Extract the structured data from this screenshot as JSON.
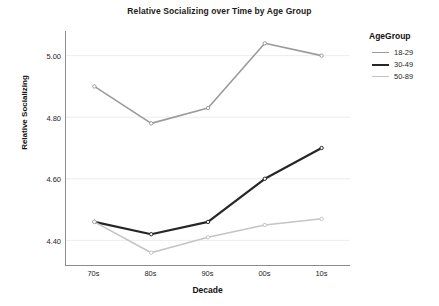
{
  "chart_data": {
    "type": "line",
    "title": "Relative Socializing over Time by Age Group",
    "xlabel": "Decade",
    "ylabel": "Relative Socializing",
    "categories": [
      "70s",
      "80s",
      "90s",
      "00s",
      "10s"
    ],
    "x_tick_labels": [
      "70s",
      "80s",
      "90s",
      "00s",
      "10s"
    ],
    "y_tick_labels": [
      "5.00",
      "4.80",
      "4.60",
      "4.40"
    ],
    "y_tick_values": [
      5.0,
      4.8,
      4.6,
      4.4
    ],
    "ylim": [
      4.32,
      5.08
    ],
    "grid": "horizontal",
    "legend_position": "right",
    "legend_title": "AgeGroup",
    "markers": true,
    "series": [
      {
        "name": "18-29",
        "color": "#9b9b9b",
        "width": 1.6,
        "values": [
          4.9,
          4.78,
          4.83,
          5.04,
          5.0
        ]
      },
      {
        "name": "30-49",
        "color": "#262626",
        "width": 2.2,
        "values": [
          4.46,
          4.42,
          4.46,
          4.6,
          4.7
        ]
      },
      {
        "name": "50-89",
        "color": "#c4c4c4",
        "width": 1.6,
        "values": [
          4.46,
          4.36,
          4.41,
          4.45,
          4.47
        ]
      }
    ]
  },
  "figure": {
    "background_color": "#ffffff",
    "axis_color": "#8c8c8c",
    "grid_color": "#ececec",
    "text_color": "#262626"
  }
}
